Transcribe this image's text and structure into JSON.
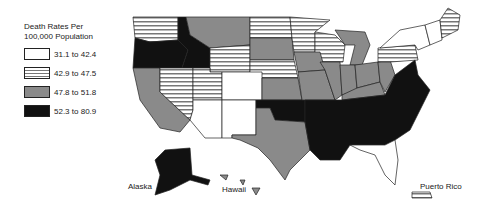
{
  "legend": {
    "title_line1": "Death Rates Per",
    "title_line2": "100,000 Population",
    "items": [
      {
        "label": "31.1 to 42.4",
        "fill": "white"
      },
      {
        "label": "42.9 to 47.5",
        "fill": "striped"
      },
      {
        "label": "47.8 to 51.8",
        "fill": "gray"
      },
      {
        "label": "52.3 to 80.9",
        "fill": "black"
      }
    ]
  },
  "labels": {
    "alaska": "Alaska",
    "hawaii": "Hawaii",
    "puerto_rico": "Puerto Rico"
  },
  "colors": {
    "white": "#ffffff",
    "stripe_bg": "#ffffff",
    "stripe_line": "#777777",
    "gray": "#8a8a8a",
    "black": "#111111"
  },
  "states": {
    "WA": "striped",
    "OR": "black",
    "ID": "black",
    "MT": "gray",
    "WY": "striped",
    "ND": "striped",
    "SD": "gray",
    "NE": "striped",
    "CA": "gray",
    "NV": "striped",
    "UT": "striped",
    "CO": "white",
    "AZ": "white",
    "NM": "white",
    "TX": "gray",
    "OK": "black",
    "KS": "gray",
    "MN": "striped",
    "WI": "striped",
    "IA": "gray",
    "MO": "gray",
    "IL": "gray",
    "MI": "gray",
    "IN": "gray",
    "OH": "gray",
    "KY": "gray",
    "WV": "gray",
    "PA": "striped",
    "NY": "white",
    "VT": "white",
    "NH": "white",
    "ME": "striped",
    "VA": "black",
    "NC": "black",
    "SC": "black",
    "GA": "black",
    "AL": "black",
    "MS": "black",
    "LA": "black",
    "AR": "black",
    "TN": "black",
    "FL": "white",
    "AK": "black",
    "HI": "gray",
    "PR": "striped"
  }
}
